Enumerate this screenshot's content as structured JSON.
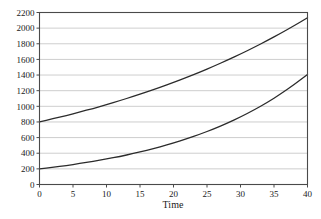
{
  "chart_data": {
    "type": "line",
    "title": "",
    "subtitle": "",
    "xlabel": "Time",
    "ylabel": "",
    "xlim": [
      0,
      40
    ],
    "ylim": [
      0,
      2200
    ],
    "grid": true,
    "grid_axis": "y",
    "legend": "none",
    "x_ticks": [
      0,
      5,
      10,
      15,
      20,
      25,
      30,
      35,
      40
    ],
    "y_ticks": [
      0,
      200,
      400,
      600,
      800,
      1000,
      1200,
      1400,
      1600,
      1800,
      2000,
      2200
    ],
    "x_tick_labels": [
      "0",
      "5",
      "10",
      "15",
      "20",
      "25",
      "30",
      "35",
      "40"
    ],
    "y_tick_labels": [
      "0",
      "200",
      "400",
      "600",
      "800",
      "1000",
      "1200",
      "1400",
      "1600",
      "1800",
      "2000",
      "2200"
    ],
    "x": [
      0,
      2,
      4,
      6,
      8,
      10,
      12,
      14,
      16,
      18,
      20,
      22,
      24,
      26,
      28,
      30,
      32,
      34,
      36,
      38,
      40
    ],
    "series": [
      {
        "name": "upper-curve",
        "color": "#2b2b2b",
        "start_value": 800,
        "end_value": 2150,
        "values": [
          800,
          840,
          882,
          927,
          973,
          1022,
          1073,
          1127,
          1184,
          1243,
          1306,
          1371,
          1440,
          1513,
          1589,
          1669,
          1753,
          1841,
          1934,
          2031,
          2133
        ]
      },
      {
        "name": "lower-curve",
        "color": "#2b2b2b",
        "start_value": 200,
        "end_value": 1400,
        "values": [
          200,
          221,
          243,
          268,
          296,
          326,
          359,
          396,
          436,
          481,
          531,
          585,
          645,
          711,
          784,
          864,
          953,
          1050,
          1158,
          1277,
          1408
        ]
      }
    ]
  },
  "axis": {
    "x_title": "Time"
  }
}
